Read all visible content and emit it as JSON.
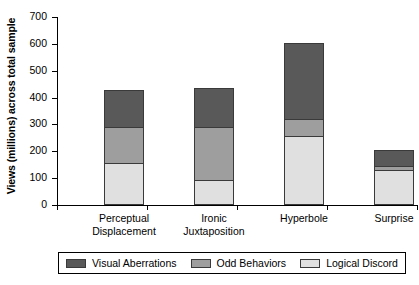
{
  "chart_data": {
    "type": "bar",
    "subtype": "stacked-vertical",
    "title": "",
    "xlabel": "",
    "ylabel": "Views (millions) across total sample",
    "ylim": [
      0,
      700
    ],
    "ytick_values": [
      0,
      100,
      200,
      300,
      400,
      500,
      600,
      700
    ],
    "ytick_labels": [
      "0",
      "100",
      "200",
      "300",
      "400",
      "500",
      "600",
      "700"
    ],
    "grid": false,
    "legend_position": "bottom",
    "categories": [
      "Perceptual Displacement",
      "Ironic Juxtaposition",
      "Hyperbole",
      "Surprise"
    ],
    "category_lines": [
      [
        "Perceptual",
        "Displacement"
      ],
      [
        "Ironic",
        "Juxtaposition"
      ],
      [
        "Hyperbole",
        ""
      ],
      [
        "Surprise",
        ""
      ]
    ],
    "series": [
      {
        "name": "Logical Discord",
        "color": "#e0e0e0",
        "stack_order": 0,
        "values": [
          156,
          95,
          257,
          130
        ]
      },
      {
        "name": "Odd Behaviors",
        "color": "#9e9e9e",
        "stack_order": 1,
        "values": [
          140,
          200,
          67,
          18
        ]
      },
      {
        "name": "Visual Aberrations",
        "color": "#595959",
        "stack_order": 2,
        "values": [
          138,
          150,
          286,
          63
        ]
      }
    ],
    "totals": [
      434,
      445,
      610,
      211
    ],
    "legend_entries": [
      "Visual Aberrations",
      "Odd Behaviors",
      "Logical Discord"
    ]
  },
  "legend": {
    "items": [
      {
        "label": "Visual Aberrations",
        "color": "#595959"
      },
      {
        "label": "Odd Behaviors",
        "color": "#9e9e9e"
      },
      {
        "label": "Logical Discord",
        "color": "#e0e0e0"
      }
    ]
  },
  "axis": {
    "y_title": "Views (millions) across total sample",
    "y_ticks": [
      "700",
      "600",
      "500",
      "400",
      "300",
      "200",
      "100",
      "0"
    ]
  },
  "colors": {
    "axis": "#000000",
    "bar_outline": "#3a3a3a",
    "background": "#ffffff"
  }
}
